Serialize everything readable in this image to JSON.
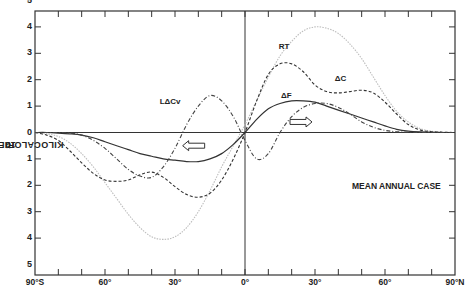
{
  "chart_data": {
    "type": "line",
    "title": "",
    "annotation": "MEAN ANNUAL CASE",
    "xlabel": "",
    "ylabel": "10^19 KILOCALORIES / YEAR",
    "ylabel_parts": {
      "base": "10",
      "exp": "19",
      "rest": " KILOCALORIES / YEAR"
    },
    "xlim": [
      -90,
      90
    ],
    "ylim": [
      -5,
      5
    ],
    "x_tick_labels": [
      "90°S",
      "60°",
      "30°",
      "0°",
      "30°",
      "60°",
      "90°N"
    ],
    "x_tick_positions": [
      -90,
      -60,
      -30,
      0,
      30,
      60,
      90
    ],
    "y_tick_labels_upper": [
      "5",
      "4",
      "3",
      "2",
      "1",
      "0"
    ],
    "y_tick_labels_lower": [
      "1",
      "2",
      "3",
      "4",
      "5"
    ],
    "grid": false,
    "legend": "inline curve labels",
    "x": [
      -90,
      -85,
      -80,
      -75,
      -70,
      -65,
      -60,
      -55,
      -50,
      -45,
      -40,
      -35,
      -30,
      -25,
      -20,
      -15,
      -10,
      -5,
      0,
      5,
      10,
      15,
      20,
      25,
      30,
      35,
      40,
      45,
      50,
      55,
      60,
      65,
      70,
      75,
      80,
      85,
      90
    ],
    "series": [
      {
        "name": "RT",
        "style": "dotted-light",
        "values": [
          0,
          -0.05,
          -0.15,
          -0.4,
          -0.8,
          -1.3,
          -1.9,
          -2.5,
          -3.1,
          -3.6,
          -3.95,
          -4.05,
          -3.95,
          -3.6,
          -3.0,
          -2.2,
          -1.3,
          -0.5,
          0.3,
          1.2,
          2.1,
          2.9,
          3.45,
          3.85,
          4.0,
          3.95,
          3.75,
          3.35,
          2.8,
          2.1,
          1.4,
          0.8,
          0.4,
          0.15,
          0.05,
          0.01,
          0
        ]
      },
      {
        "name": "ΔC",
        "style": "dashed",
        "values": [
          0,
          -0.1,
          -0.3,
          -0.7,
          -1.15,
          -1.55,
          -1.8,
          -1.85,
          -1.8,
          -1.6,
          -1.5,
          -1.7,
          -2.05,
          -2.35,
          -2.45,
          -2.3,
          -1.8,
          -1.0,
          0.0,
          1.2,
          2.2,
          2.6,
          2.6,
          2.3,
          1.8,
          1.55,
          1.5,
          1.55,
          1.6,
          1.5,
          1.15,
          0.7,
          0.3,
          0.1,
          0.03,
          0.01,
          0
        ]
      },
      {
        "name": "ΔF",
        "style": "solid",
        "values": [
          0,
          0,
          -0.02,
          -0.05,
          -0.1,
          -0.2,
          -0.35,
          -0.5,
          -0.65,
          -0.8,
          -0.9,
          -1.0,
          -1.05,
          -1.1,
          -1.1,
          -1.0,
          -0.8,
          -0.45,
          0.0,
          0.5,
          0.9,
          1.1,
          1.2,
          1.2,
          1.15,
          1.0,
          0.85,
          0.7,
          0.55,
          0.4,
          0.25,
          0.12,
          0.05,
          0.02,
          0.01,
          0,
          0
        ]
      },
      {
        "name": "LΔCv",
        "style": "dash-dot",
        "values": [
          0,
          0,
          0,
          -0.02,
          -0.1,
          -0.3,
          -0.6,
          -1.0,
          -1.4,
          -1.65,
          -1.7,
          -1.3,
          -0.6,
          0.3,
          1.0,
          1.4,
          1.2,
          0.6,
          -0.3,
          -1.0,
          -0.8,
          0.0,
          0.6,
          0.95,
          1.1,
          1.1,
          0.95,
          0.7,
          0.4,
          0.2,
          0.08,
          0.03,
          0.01,
          0,
          0,
          0,
          0
        ]
      }
    ],
    "curve_labels": [
      {
        "text": "RT",
        "x": 17,
        "y": 3.2
      },
      {
        "text": "ΔC",
        "x": 41,
        "y": 2.0
      },
      {
        "text": "ΔF",
        "x": 18,
        "y": 1.35
      },
      {
        "text": "LΔCv",
        "x": -34,
        "y": 1.1
      }
    ],
    "arrows": [
      {
        "direction": "left",
        "x": -22,
        "y": -0.5,
        "meaning": "southward transport"
      },
      {
        "direction": "right",
        "x": 24,
        "y": 0.4,
        "meaning": "northward transport"
      }
    ]
  }
}
